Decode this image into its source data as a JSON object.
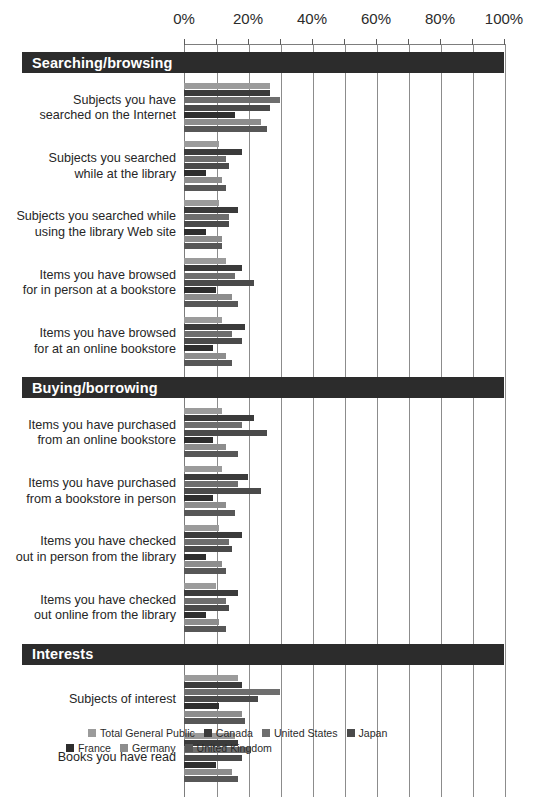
{
  "chart_data": {
    "type": "bar",
    "orientation": "horizontal",
    "title": "",
    "xlabel": "",
    "ylabel": "",
    "xlim": [
      0,
      100
    ],
    "xticks": [
      0,
      10,
      20,
      30,
      40,
      50,
      60,
      70,
      80,
      90,
      100
    ],
    "xtick_labels": [
      "0%",
      "20%",
      "40%",
      "60%",
      "80%",
      "100%"
    ],
    "xtick_label_values": [
      0,
      20,
      40,
      60,
      80,
      100
    ],
    "grid": true,
    "legend_position": "bottom",
    "series": [
      {
        "name": "Total General Public",
        "color": "#9b9b9b"
      },
      {
        "name": "Canada",
        "color": "#3b3b3b"
      },
      {
        "name": "United States",
        "color": "#6e6e6e"
      },
      {
        "name": "Japan",
        "color": "#4a4a4a"
      },
      {
        "name": "France",
        "color": "#2e2e2e"
      },
      {
        "name": "Germany",
        "color": "#8d8d8d"
      },
      {
        "name": "United Kingdom",
        "color": "#575757"
      }
    ],
    "sections": [
      {
        "label": "Searching/browsing",
        "categories": [
          {
            "label_lines": [
              "Subjects you have",
              "searched on the Internet"
            ],
            "values": [
              27,
              27,
              30,
              27,
              16,
              24,
              26
            ]
          },
          {
            "label_lines": [
              "Subjects you searched",
              "while at the library"
            ],
            "values": [
              11,
              18,
              13,
              14,
              7,
              12,
              13
            ]
          },
          {
            "label_lines": [
              "Subjects you searched while",
              "using the library Web site"
            ],
            "values": [
              11,
              17,
              14,
              14,
              7,
              12,
              12
            ]
          },
          {
            "label_lines": [
              "Items you have browsed",
              "for in person at a bookstore"
            ],
            "values": [
              13,
              18,
              16,
              22,
              10,
              15,
              17
            ]
          },
          {
            "label_lines": [
              "Items you have browsed",
              "for at an online bookstore"
            ],
            "values": [
              12,
              19,
              15,
              18,
              9,
              13,
              15
            ]
          }
        ]
      },
      {
        "label": "Buying/borrowing",
        "categories": [
          {
            "label_lines": [
              "Items you have purchased",
              "from an online bookstore"
            ],
            "values": [
              12,
              22,
              18,
              26,
              9,
              13,
              17
            ]
          },
          {
            "label_lines": [
              "Items you have purchased",
              "from a bookstore in person"
            ],
            "values": [
              12,
              20,
              17,
              24,
              9,
              13,
              16
            ]
          },
          {
            "label_lines": [
              "Items you have checked",
              "out in person from the library"
            ],
            "values": [
              11,
              18,
              14,
              15,
              7,
              12,
              13
            ]
          },
          {
            "label_lines": [
              "Items you have checked",
              "out online from the library"
            ],
            "values": [
              10,
              17,
              13,
              14,
              7,
              11,
              13
            ]
          }
        ]
      },
      {
        "label": "Interests",
        "categories": [
          {
            "label_lines": [
              "Subjects of interest"
            ],
            "values": [
              17,
              18,
              30,
              23,
              11,
              18,
              19
            ]
          },
          {
            "label_lines": [
              "Books you have read"
            ],
            "values": [
              16,
              17,
              21,
              18,
              10,
              15,
              17
            ]
          }
        ]
      }
    ]
  },
  "legend": {
    "rows": [
      [
        {
          "label": "Total General Public",
          "color": "#9b9b9b"
        },
        {
          "label": "Canada",
          "color": "#3b3b3b"
        },
        {
          "label": "United States",
          "color": "#6e6e6e"
        },
        {
          "label": "Japan",
          "color": "#4a4a4a"
        }
      ],
      [
        {
          "label": "France",
          "color": "#2e2e2e"
        },
        {
          "label": "Germany",
          "color": "#8d8d8d"
        },
        {
          "label": "United Kingdom",
          "color": "#575757"
        }
      ]
    ]
  }
}
